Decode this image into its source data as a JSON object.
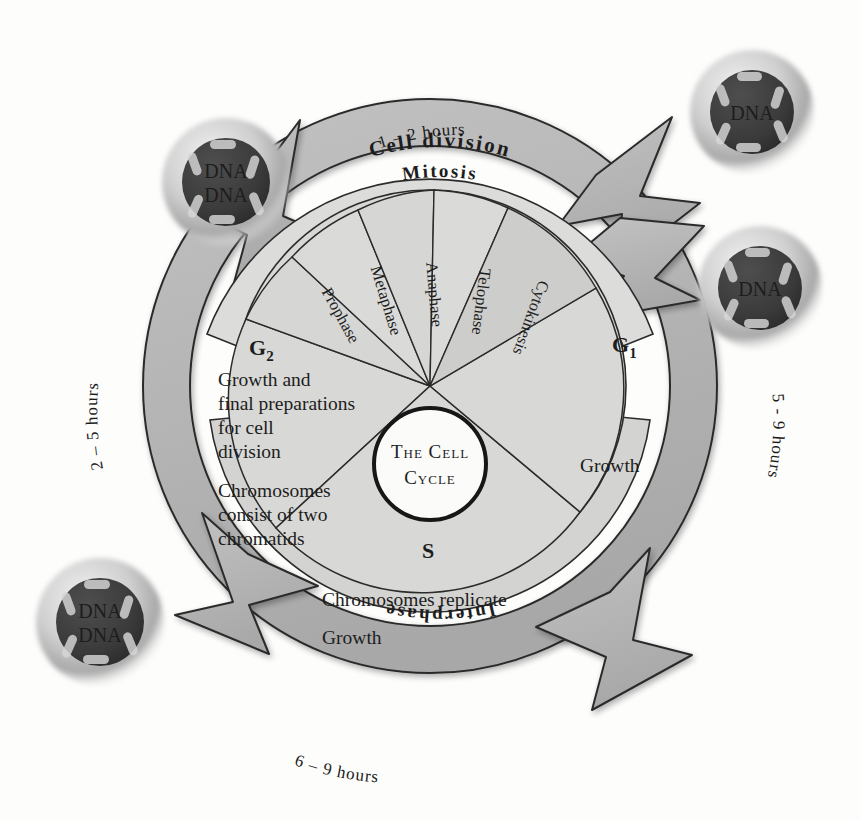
{
  "figure": {
    "title": "The Cell Cycle",
    "center_line_1": "The Cell",
    "center_line_2": "Cycle"
  },
  "bands": {
    "outer_label": "Cell division",
    "mitosis_label": "Mitosis",
    "interphase_label": "Interphase"
  },
  "durations": {
    "cell_division": "1 – 2  hours",
    "g2": "2 – 5  hours",
    "g1": "5 - 9  hours",
    "interphase": "6 – 9  hours"
  },
  "mitosis_phases": [
    {
      "label": "Prophase"
    },
    {
      "label": "Metaphase"
    },
    {
      "label": "Anaphase"
    },
    {
      "label": "Telophase"
    },
    {
      "label": "Cytokinesis"
    }
  ],
  "sectors": {
    "g2": {
      "name": "G2",
      "subscript": "2",
      "lines": [
        "Growth and",
        "final preparations",
        "for cell",
        "division"
      ],
      "lines2": [
        "Chromosomes",
        "consist of two",
        "chromatids"
      ]
    },
    "g1": {
      "name": "G1",
      "subscript": "1",
      "lines": [
        "Growth"
      ]
    },
    "s": {
      "name": "S",
      "lines": [
        "Chromosomes replicate",
        "Growth"
      ]
    }
  },
  "cells": [
    {
      "id": "parent-top-left",
      "labels": [
        "DNA",
        "DNA"
      ]
    },
    {
      "id": "daughter-top-right",
      "labels": [
        "DNA"
      ]
    },
    {
      "id": "daughter-right",
      "labels": [
        "DNA"
      ]
    },
    {
      "id": "parent-bottom-left",
      "labels": [
        "DNA",
        "DNA"
      ]
    }
  ],
  "colors": {
    "page_background": "#fdfdfc",
    "ring_fill": "#c9c9c9",
    "sector_fill": "#d8d8d6",
    "band_fill": "#dcdcda",
    "arrow_fill": "#b3b3b3",
    "stroke": "#2b2b2b",
    "center_fill": "#fbfbfa",
    "nucleus_fill": "#3a3a3a",
    "text": "#1d1d1d"
  }
}
